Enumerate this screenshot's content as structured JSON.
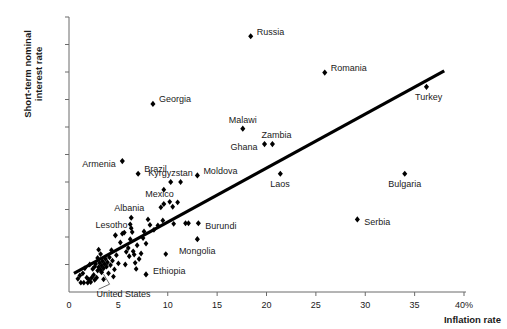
{
  "chart_data": {
    "type": "scatter",
    "title": "",
    "xlabel": "Inflation rate",
    "ylabel_line1": "Short-term nominal",
    "ylabel_line2": "interest rate",
    "xlim": [
      0,
      40
    ],
    "ylim": [
      0,
      50
    ],
    "grid": false,
    "legend": false,
    "xticks": [
      {
        "value": 0,
        "label": "0"
      },
      {
        "value": 5,
        "label": "5"
      },
      {
        "value": 10,
        "label": "10"
      },
      {
        "value": 15,
        "label": "15"
      },
      {
        "value": 20,
        "label": "20"
      },
      {
        "value": 25,
        "label": "25"
      },
      {
        "value": 30,
        "label": "30"
      },
      {
        "value": 35,
        "label": "35"
      },
      {
        "value": 40,
        "label": "40%"
      }
    ],
    "yticks": [
      {
        "value": 0,
        "label": "0"
      },
      {
        "value": 5,
        "label": "5"
      },
      {
        "value": 10,
        "label": "10"
      },
      {
        "value": 15,
        "label": "15"
      },
      {
        "value": 20,
        "label": "20"
      },
      {
        "value": 25,
        "label": "25"
      },
      {
        "value": 30,
        "label": "30"
      },
      {
        "value": 35,
        "label": "35"
      },
      {
        "value": 40,
        "label": "40"
      },
      {
        "value": 45,
        "label": "45"
      },
      {
        "value": 50,
        "label": "50%"
      }
    ],
    "marker_color": "#000000",
    "line_color": "#000000",
    "trend_line": {
      "x1": 0.5,
      "y1": 3.4,
      "x2": 38.0,
      "y2": 40.2
    },
    "labeled_points": [
      {
        "name": "Russia",
        "x": 18.4,
        "y": 46.5,
        "label_dx": 6,
        "label_dy": -3.5,
        "anchor": "start"
      },
      {
        "name": "Romania",
        "x": 25.9,
        "y": 39.9,
        "label_dx": 6,
        "label_dy": -3.5,
        "anchor": "start"
      },
      {
        "name": "Turkey",
        "x": 36.2,
        "y": 37.3,
        "label_dx": 2,
        "label_dy": 11,
        "anchor": "middle"
      },
      {
        "name": "Georgia",
        "x": 8.5,
        "y": 34.2,
        "label_dx": 6,
        "label_dy": -3.5,
        "anchor": "start"
      },
      {
        "name": "Malawi",
        "x": 17.6,
        "y": 29.7,
        "label_dx": 0,
        "label_dy": -8,
        "anchor": "middle"
      },
      {
        "name": "Zambia",
        "x": 20.6,
        "y": 26.9,
        "label_dx": 4,
        "label_dy": -8,
        "anchor": "middle"
      },
      {
        "name": "Ghana",
        "x": 19.8,
        "y": 26.9,
        "label_dx": -7,
        "label_dy": 3.5,
        "anchor": "end"
      },
      {
        "name": "Armenia",
        "x": 5.4,
        "y": 23.8,
        "label_dx": -6,
        "label_dy": 3.5,
        "anchor": "end"
      },
      {
        "name": "Kyrgyzstan",
        "x": 10.3,
        "y": 20.0,
        "label_dx": 0,
        "label_dy": -8,
        "anchor": "middle"
      },
      {
        "name": "Brazil",
        "x": 7.0,
        "y": 21.5,
        "label_dx": 6,
        "label_dy": -3.5,
        "anchor": "start"
      },
      {
        "name": "Moldova",
        "x": 13.0,
        "y": 21.2,
        "label_dx": 6,
        "label_dy": -3.5,
        "anchor": "start"
      },
      {
        "name": "Mexico",
        "x": 9.6,
        "y": 16.0,
        "label_dx": -4,
        "label_dy": -9,
        "anchor": "middle"
      },
      {
        "name": "Albania",
        "x": 6.3,
        "y": 13.5,
        "label_dx": -2,
        "label_dy": -9,
        "anchor": "middle"
      },
      {
        "name": "Lesotho",
        "x": 4.7,
        "y": 10.3,
        "label_dx": -4,
        "label_dy": -9,
        "anchor": "middle"
      },
      {
        "name": "Burundi",
        "x": 13.1,
        "y": 12.5,
        "label_dx": 7,
        "label_dy": 3.5,
        "anchor": "start"
      },
      {
        "name": "Mongolia",
        "x": 13.0,
        "y": 9.6,
        "label_dx": 0,
        "label_dy": 13,
        "anchor": "middle"
      },
      {
        "name": "Ethiopia",
        "x": 7.8,
        "y": 3.2,
        "label_dx": 7,
        "label_dy": -2,
        "anchor": "start"
      },
      {
        "name": "United States",
        "x": 3.3,
        "y": 3.6,
        "label_dx": 0,
        "label_dy": 0,
        "anchor": "leader"
      },
      {
        "name": "Laos",
        "x": 21.4,
        "y": 21.5,
        "label_dx": 0,
        "label_dy": 11,
        "anchor": "middle"
      },
      {
        "name": "Bulgaria",
        "x": 34.0,
        "y": 21.5,
        "label_dx": 0,
        "label_dy": 11,
        "anchor": "middle"
      },
      {
        "name": "Serbia",
        "x": 29.2,
        "y": 13.2,
        "label_dx": 7,
        "label_dy": 3.5,
        "anchor": "start"
      }
    ],
    "unlabeled_points": [
      {
        "x": 1.2,
        "y": 1.7
      },
      {
        "x": 1.5,
        "y": 1.7
      },
      {
        "x": 1.9,
        "y": 1.7
      },
      {
        "x": 2.2,
        "y": 1.8
      },
      {
        "x": 1.1,
        "y": 3.0
      },
      {
        "x": 1.4,
        "y": 3.4
      },
      {
        "x": 1.8,
        "y": 2.6
      },
      {
        "x": 2.0,
        "y": 2.3
      },
      {
        "x": 2.3,
        "y": 2.6
      },
      {
        "x": 2.5,
        "y": 3.1
      },
      {
        "x": 2.6,
        "y": 2.2
      },
      {
        "x": 2.8,
        "y": 2.6
      },
      {
        "x": 2.4,
        "y": 4.2
      },
      {
        "x": 2.6,
        "y": 4.6
      },
      {
        "x": 2.7,
        "y": 5.1
      },
      {
        "x": 2.9,
        "y": 3.9
      },
      {
        "x": 3.0,
        "y": 4.5
      },
      {
        "x": 3.1,
        "y": 5.3
      },
      {
        "x": 3.2,
        "y": 4.0
      },
      {
        "x": 3.3,
        "y": 4.8
      },
      {
        "x": 3.4,
        "y": 5.6
      },
      {
        "x": 3.5,
        "y": 4.3
      },
      {
        "x": 3.6,
        "y": 5.1
      },
      {
        "x": 3.7,
        "y": 6.0
      },
      {
        "x": 3.8,
        "y": 4.6
      },
      {
        "x": 3.9,
        "y": 5.4
      },
      {
        "x": 4.0,
        "y": 3.4
      },
      {
        "x": 4.1,
        "y": 6.3
      },
      {
        "x": 4.2,
        "y": 4.9
      },
      {
        "x": 4.3,
        "y": 7.6
      },
      {
        "x": 4.4,
        "y": 5.7
      },
      {
        "x": 4.6,
        "y": 4.1
      },
      {
        "x": 4.8,
        "y": 6.7
      },
      {
        "x": 3.0,
        "y": 7.7
      },
      {
        "x": 3.2,
        "y": 6.9
      },
      {
        "x": 2.9,
        "y": 6.2
      },
      {
        "x": 5.0,
        "y": 5.2
      },
      {
        "x": 5.2,
        "y": 9.0
      },
      {
        "x": 5.4,
        "y": 10.6
      },
      {
        "x": 5.6,
        "y": 10.8
      },
      {
        "x": 5.8,
        "y": 7.3
      },
      {
        "x": 6.0,
        "y": 8.0
      },
      {
        "x": 6.1,
        "y": 6.5
      },
      {
        "x": 6.2,
        "y": 12.3
      },
      {
        "x": 6.3,
        "y": 11.6
      },
      {
        "x": 6.4,
        "y": 10.9
      },
      {
        "x": 6.5,
        "y": 7.4
      },
      {
        "x": 6.6,
        "y": 6.8
      },
      {
        "x": 6.7,
        "y": 5.3
      },
      {
        "x": 6.8,
        "y": 4.2
      },
      {
        "x": 6.9,
        "y": 8.5
      },
      {
        "x": 7.1,
        "y": 6.0
      },
      {
        "x": 7.3,
        "y": 7.0
      },
      {
        "x": 7.5,
        "y": 9.8
      },
      {
        "x": 7.6,
        "y": 11.0
      },
      {
        "x": 7.8,
        "y": 8.8
      },
      {
        "x": 8.0,
        "y": 13.2
      },
      {
        "x": 8.2,
        "y": 12.2
      },
      {
        "x": 8.6,
        "y": 11.3
      },
      {
        "x": 9.0,
        "y": 12.1
      },
      {
        "x": 9.3,
        "y": 15.4
      },
      {
        "x": 9.5,
        "y": 13.0
      },
      {
        "x": 9.6,
        "y": 18.6
      },
      {
        "x": 9.8,
        "y": 6.9
      },
      {
        "x": 10.2,
        "y": 16.4
      },
      {
        "x": 10.5,
        "y": 15.5
      },
      {
        "x": 10.6,
        "y": 12.4
      },
      {
        "x": 11.0,
        "y": 16.3
      },
      {
        "x": 11.3,
        "y": 20.0
      },
      {
        "x": 11.8,
        "y": 12.5
      },
      {
        "x": 12.1,
        "y": 12.5
      },
      {
        "x": 6.2,
        "y": 9.6
      },
      {
        "x": 5.7,
        "y": 5.0
      },
      {
        "x": 4.5,
        "y": 2.8
      },
      {
        "x": 3.5,
        "y": 2.3
      },
      {
        "x": 2.1,
        "y": 5.0
      },
      {
        "x": 1.6,
        "y": 4.3
      },
      {
        "x": 0.9,
        "y": 2.4
      }
    ]
  }
}
